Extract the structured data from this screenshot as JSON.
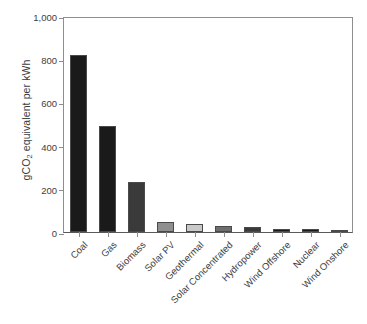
{
  "chart_data": {
    "type": "bar",
    "title": "",
    "subtitle": "",
    "xlabel": "",
    "ylabel": "gCO2 equivalent per kWh",
    "ylabel_prefix": "gCO",
    "ylabel_subscript": "2",
    "ylabel_suffix": " equivalent per kWh",
    "categories": [
      "Coal",
      "Gas",
      "Biomass",
      "Solar PV",
      "Geothermal",
      "Solar Concentrated",
      "Hydropower",
      "Wind Offshore",
      "Nuclear",
      "Wind Onshore"
    ],
    "values": [
      820,
      490,
      230,
      48,
      38,
      27,
      24,
      12,
      12,
      11
    ],
    "bar_colors": [
      "#1a1a1a",
      "#1a1a1a",
      "#3a3a3a",
      "#8f8f8f",
      "#c9c9c9",
      "#6e6e6e",
      "#3a3a3a",
      "#1a1a1a",
      "#1a1a1a",
      "#2a2a2a"
    ],
    "ylim": [
      0,
      1000
    ],
    "yticks": [
      0,
      200,
      400,
      600,
      800,
      1000
    ],
    "ytick_labels": [
      "0",
      "200",
      "400",
      "600",
      "800",
      "1,000"
    ],
    "grid": false,
    "legend": false,
    "legend_position": "none",
    "axis_color": "#8e8e8e",
    "text_color": "#3d3d3d",
    "background": "#ffffff"
  }
}
